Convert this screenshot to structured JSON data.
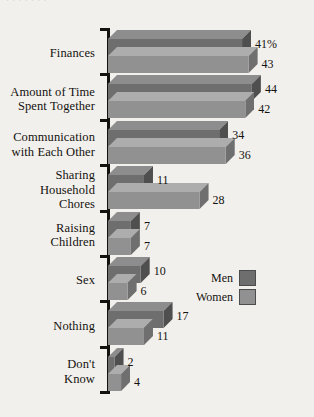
{
  "top_clipped_text": "· ·   ·  ·     ·      ·       ·",
  "legend": {
    "items": [
      {
        "label": "Men",
        "color": "#6e6e6e"
      },
      {
        "label": "Women",
        "color": "#919191"
      }
    ]
  },
  "colors": {
    "background": "#f2f0ec",
    "axis": "#14120f",
    "text": "#14120f",
    "men_front": "#6e6e6e",
    "men_top": "#8d8d8d",
    "men_side": "#4f4f4f",
    "women_front": "#919191",
    "women_top": "#adadad",
    "women_side": "#6f6f6f"
  },
  "chart_data": {
    "type": "bar",
    "orientation": "horizontal",
    "style": "3d",
    "title": "",
    "xlabel": "",
    "ylabel": "",
    "grid": false,
    "legend_position": "center-right",
    "categories": [
      "Finances",
      "Amount of Time\nSpent Together",
      "Communication\nwith Each Other",
      "Sharing\nHousehold\nChores",
      "Raising\nChildren",
      "Sex",
      "Nothing",
      "Don't\nKnow"
    ],
    "series": [
      {
        "name": "Men",
        "values": [
          41,
          44,
          34,
          11,
          7,
          10,
          17,
          2
        ],
        "labels": [
          "41%",
          "44",
          "34",
          "11",
          "7",
          "10",
          "17",
          "2"
        ]
      },
      {
        "name": "Women",
        "values": [
          43,
          42,
          36,
          28,
          7,
          6,
          11,
          4
        ],
        "labels": [
          "43",
          "42",
          "36",
          "28",
          "7",
          "6",
          "11",
          "4"
        ]
      }
    ],
    "xlim": [
      0,
      46
    ],
    "value_unit": "percent"
  }
}
